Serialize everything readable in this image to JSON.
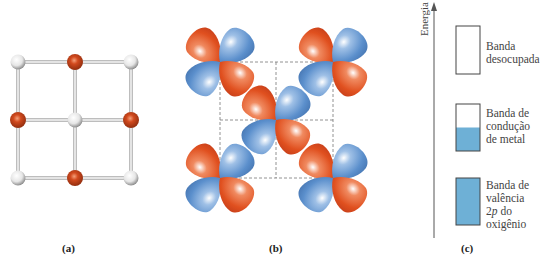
{
  "figure": {
    "panels": [
      {
        "id": "a",
        "label": "(a)",
        "description": "square lattice of metal (white) and oxygen (red) atoms"
      },
      {
        "id": "b",
        "label": "(b)",
        "description": "d-orbital lobes of metal atoms overlapping"
      },
      {
        "id": "c",
        "label": "(c)",
        "description": "energy band diagram"
      }
    ],
    "lattice": {
      "rows": [
        [
          "metal",
          "oxygen",
          "metal"
        ],
        [
          "oxygen",
          "metal",
          "oxygen"
        ],
        [
          "metal",
          "oxygen",
          "metal"
        ]
      ],
      "colors": {
        "metal": "#e8e8e8",
        "oxygen": "#c8401c",
        "bond": "#cfcfcf"
      }
    },
    "orbitals": {
      "colors": {
        "positive": "#e2562a",
        "negative": "#5b8fcc",
        "grid": "#777777"
      },
      "lobe_order": [
        "positive",
        "negative",
        "negative",
        "positive"
      ]
    },
    "energy_diagram": {
      "axis_label": "Energia",
      "fill_color": "#6eb0d6",
      "bands": [
        {
          "name": "empty-band",
          "label": "Banda\ndesocupada",
          "fill_fraction": 0
        },
        {
          "name": "metal-conduction-band",
          "label": "Banda de\ncondução\nde metal",
          "fill_fraction": 0.5
        },
        {
          "name": "oxygen-valence-band",
          "label": "Banda de\nvalência\n2p do\noxigênio",
          "fill_fraction": 1
        }
      ]
    }
  }
}
